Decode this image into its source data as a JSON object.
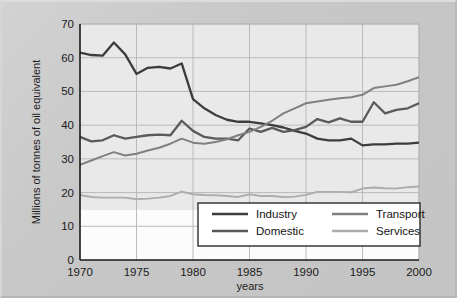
{
  "figure": {
    "background_color": "#c9c9c9",
    "plot_background_color": "#e9e9e9",
    "plot_background_lower_color": "#fdfdfd"
  },
  "chart_data": {
    "type": "line",
    "title": "",
    "xlabel": "years",
    "ylabel": "Millions of tonnes of oil equivalent",
    "xlim": [
      1970,
      2000
    ],
    "ylim": [
      0,
      70
    ],
    "xticks": [
      1970,
      1975,
      1980,
      1985,
      1990,
      1995,
      2000
    ],
    "xtick_labels": [
      "1970",
      "1975",
      "1980",
      "1985",
      "1990",
      "1995",
      "2000"
    ],
    "yticks": [
      0,
      10,
      20,
      30,
      40,
      50,
      60,
      70
    ],
    "ytick_labels": [
      "0",
      "10",
      "20",
      "30",
      "40",
      "50",
      "60",
      "70"
    ],
    "grid": true,
    "legend_position": "lower center",
    "x": [
      1970,
      1971,
      1972,
      1973,
      1974,
      1975,
      1976,
      1977,
      1978,
      1979,
      1980,
      1981,
      1982,
      1983,
      1984,
      1985,
      1986,
      1987,
      1988,
      1989,
      1990,
      1991,
      1992,
      1993,
      1994,
      1995,
      1996,
      1997,
      1998,
      1999,
      2000
    ],
    "series": [
      {
        "name": "Industry",
        "color": "#3c3c3c",
        "values": [
          61.5,
          60.8,
          60.6,
          64.5,
          61.0,
          55.2,
          57.0,
          57.3,
          56.8,
          58.3,
          47.7,
          45.0,
          43.0,
          41.6,
          41.0,
          41.0,
          40.5,
          40.0,
          39.3,
          38.3,
          37.5,
          36.0,
          35.5,
          35.5,
          36.0,
          34.0,
          34.3,
          34.3,
          34.5,
          34.5,
          34.8
        ]
      },
      {
        "name": "Domestic",
        "color": "#5a5a5a",
        "values": [
          36.5,
          35.2,
          35.5,
          37.0,
          36.0,
          36.5,
          37.0,
          37.2,
          37.0,
          41.3,
          38.3,
          36.5,
          36.0,
          36.0,
          35.5,
          39.0,
          38.0,
          39.2,
          38.0,
          38.5,
          39.5,
          41.8,
          40.8,
          42.0,
          41.0,
          41.0,
          46.8,
          43.5,
          44.5,
          45.0,
          46.5
        ]
      },
      {
        "name": "Transport",
        "color": "#808080",
        "values": [
          28.2,
          29.5,
          30.8,
          32.0,
          31.0,
          31.5,
          32.5,
          33.3,
          34.5,
          36.0,
          34.8,
          34.5,
          35.0,
          35.8,
          37.0,
          38.0,
          39.5,
          41.3,
          43.5,
          45.0,
          46.5,
          47.0,
          47.5,
          48.0,
          48.3,
          49.0,
          51.0,
          51.5,
          52.0,
          53.0,
          54.2
        ]
      },
      {
        "name": "Services",
        "color": "#adadad",
        "values": [
          19.3,
          18.7,
          18.5,
          18.5,
          18.5,
          18.0,
          18.2,
          18.5,
          19.0,
          20.3,
          19.5,
          19.3,
          19.2,
          19.0,
          18.7,
          19.5,
          19.0,
          19.0,
          18.7,
          18.8,
          19.3,
          20.2,
          20.2,
          20.2,
          20.1,
          21.2,
          21.5,
          21.3,
          21.2,
          21.6,
          21.8
        ]
      }
    ]
  },
  "legend": {
    "entries": [
      {
        "label": "Industry",
        "color": "#3c3c3c"
      },
      {
        "label": "Transport",
        "color": "#808080"
      },
      {
        "label": "Domestic",
        "color": "#5a5a5a"
      },
      {
        "label": "Services",
        "color": "#adadad"
      }
    ]
  }
}
